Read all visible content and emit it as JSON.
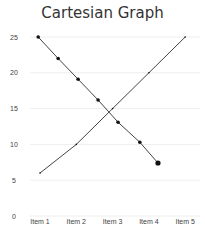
{
  "chart_data": {
    "type": "line",
    "title": "Cartesian Graph",
    "xlabel": "",
    "ylabel": "",
    "categories": [
      "Item 1",
      "Item 2",
      "Item 3",
      "Item 4",
      "Item 5"
    ],
    "yticks": [
      0,
      5,
      10,
      15,
      20,
      25
    ],
    "ylim": [
      0,
      25
    ],
    "grid": true,
    "legend": "none",
    "series": [
      {
        "name": "Series A (ascending)",
        "x": [
          1,
          2,
          3,
          4,
          5
        ],
        "values": [
          6,
          10,
          15,
          20,
          25
        ],
        "color": "#444444",
        "markers": false
      },
      {
        "name": "Series B (descending)",
        "x": [
          0.95,
          1.5,
          2.05,
          2.6,
          3.15,
          3.75,
          4.25
        ],
        "values": [
          25,
          22,
          19.1,
          16.2,
          13.1,
          10.3,
          7.4
        ],
        "color": "#444444",
        "markers": true
      }
    ]
  }
}
